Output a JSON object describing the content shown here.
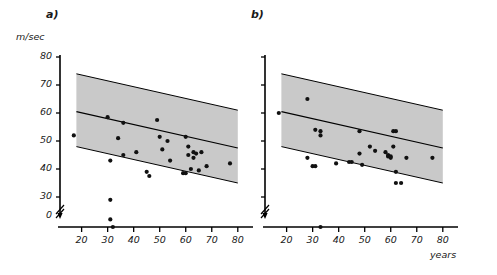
{
  "figure": {
    "panel_a_label": "a)",
    "panel_b_label": "b)",
    "y_axis_title": "m/sec",
    "x_axis_title": "years"
  },
  "chart_data": [
    {
      "type": "scatter",
      "title": "a)",
      "xlabel": "years",
      "ylabel": "m/sec",
      "xlim": [
        14,
        82
      ],
      "ylim": [
        0,
        80
      ],
      "xticks": [
        20,
        30,
        40,
        50,
        60,
        70,
        80
      ],
      "yticks": [
        30,
        40,
        50,
        60,
        70,
        80
      ],
      "y_axis_break": true,
      "y_axis_origin_label": "0",
      "grid": false,
      "legend": "none",
      "regression_line": {
        "name": "regression line",
        "x": [
          18,
          80
        ],
        "y": [
          60.5,
          47.5
        ]
      },
      "confidence_band": {
        "name": "confidence band",
        "upper": {
          "x": [
            18,
            80
          ],
          "y": [
            74.0,
            61.0
          ]
        },
        "lower": {
          "x": [
            18,
            80
          ],
          "y": [
            48.0,
            35.0
          ]
        },
        "fill_color": "#c9c9c9"
      },
      "points": [
        {
          "x": 17,
          "y": 52
        },
        {
          "x": 30,
          "y": 58.5
        },
        {
          "x": 31,
          "y": 43
        },
        {
          "x": 31,
          "y": 29
        },
        {
          "x": 31,
          "y": 22
        },
        {
          "x": 32,
          "y": 0
        },
        {
          "x": 34,
          "y": 51
        },
        {
          "x": 36,
          "y": 56.5
        },
        {
          "x": 36,
          "y": 45
        },
        {
          "x": 41,
          "y": 46
        },
        {
          "x": 45,
          "y": 39
        },
        {
          "x": 46,
          "y": 37.5
        },
        {
          "x": 49,
          "y": 57.5
        },
        {
          "x": 50,
          "y": 51.5
        },
        {
          "x": 51,
          "y": 47
        },
        {
          "x": 53,
          "y": 50
        },
        {
          "x": 54,
          "y": 43
        },
        {
          "x": 59,
          "y": 38.5
        },
        {
          "x": 60,
          "y": 38.5
        },
        {
          "x": 60,
          "y": 51.5
        },
        {
          "x": 61,
          "y": 45
        },
        {
          "x": 61,
          "y": 48
        },
        {
          "x": 62,
          "y": 40
        },
        {
          "x": 63,
          "y": 44
        },
        {
          "x": 63,
          "y": 46
        },
        {
          "x": 64,
          "y": 45.5
        },
        {
          "x": 65,
          "y": 39.5
        },
        {
          "x": 66,
          "y": 46
        },
        {
          "x": 68,
          "y": 41
        },
        {
          "x": 77,
          "y": 42
        }
      ]
    },
    {
      "type": "scatter",
      "title": "b)",
      "xlabel": "years",
      "ylabel": "m/sec",
      "xlim": [
        14,
        82
      ],
      "ylim": [
        0,
        80
      ],
      "xticks": [
        20,
        30,
        40,
        50,
        60,
        70,
        80
      ],
      "yticks": [
        30,
        40,
        50,
        60,
        70,
        80
      ],
      "y_axis_break": true,
      "y_axis_tick_labels_shown": false,
      "grid": false,
      "legend": "none",
      "regression_line": {
        "name": "regression line",
        "x": [
          18,
          80
        ],
        "y": [
          60.5,
          47.5
        ]
      },
      "confidence_band": {
        "name": "confidence band",
        "upper": {
          "x": [
            18,
            80
          ],
          "y": [
            74.0,
            61.0
          ]
        },
        "lower": {
          "x": [
            18,
            80
          ],
          "y": [
            48.0,
            35.0
          ]
        },
        "fill_color": "#c9c9c9"
      },
      "points": [
        {
          "x": 17,
          "y": 60
        },
        {
          "x": 28,
          "y": 65
        },
        {
          "x": 28,
          "y": 44
        },
        {
          "x": 30,
          "y": 41
        },
        {
          "x": 31,
          "y": 41
        },
        {
          "x": 31,
          "y": 54
        },
        {
          "x": 33,
          "y": 53.5
        },
        {
          "x": 33,
          "y": 52
        },
        {
          "x": 33,
          "y": 0
        },
        {
          "x": 39,
          "y": 42
        },
        {
          "x": 44,
          "y": 42.5
        },
        {
          "x": 45,
          "y": 42.5
        },
        {
          "x": 48,
          "y": 53.5
        },
        {
          "x": 48,
          "y": 45.5
        },
        {
          "x": 49,
          "y": 41.5
        },
        {
          "x": 52,
          "y": 48
        },
        {
          "x": 54,
          "y": 46.5
        },
        {
          "x": 58,
          "y": 46
        },
        {
          "x": 59,
          "y": 45
        },
        {
          "x": 59,
          "y": 44.5
        },
        {
          "x": 60,
          "y": 44.5
        },
        {
          "x": 60,
          "y": 44
        },
        {
          "x": 61,
          "y": 48
        },
        {
          "x": 61,
          "y": 53.5
        },
        {
          "x": 62,
          "y": 39
        },
        {
          "x": 62,
          "y": 53.5
        },
        {
          "x": 62,
          "y": 35
        },
        {
          "x": 64,
          "y": 35
        },
        {
          "x": 66,
          "y": 44
        },
        {
          "x": 76,
          "y": 44
        }
      ]
    }
  ]
}
